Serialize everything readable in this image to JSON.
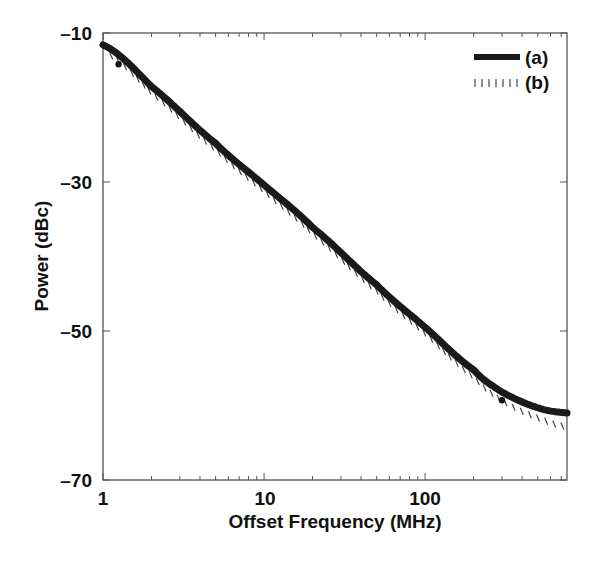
{
  "chart_data": {
    "type": "line",
    "title": "",
    "xlabel": "Offset Frequency (MHz)",
    "ylabel": "Power (dBc)",
    "xscale": "log",
    "xlim": [
      1,
      760
    ],
    "ylim": [
      -70,
      -10
    ],
    "xticks": [
      "1",
      "10",
      "100"
    ],
    "yticks": [
      "-10",
      "-30",
      "-50",
      "-70"
    ],
    "grid": false,
    "legend_position": "upper right",
    "series": [
      {
        "name": "(a)",
        "style": "thick solid",
        "x": [
          1,
          2,
          5,
          10,
          20,
          50,
          100,
          200,
          300,
          500,
          760
        ],
        "y": [
          -11.6,
          -17.2,
          -24.8,
          -30.4,
          -36.1,
          -43.8,
          -49.5,
          -55.2,
          -58.2,
          -60.3,
          -61.0
        ]
      },
      {
        "name": "(b)",
        "style": "hatched",
        "x": [
          1,
          2,
          5,
          10,
          20,
          50,
          100,
          200,
          300,
          500,
          760
        ],
        "y": [
          -12.4,
          -18.0,
          -25.6,
          -31.2,
          -36.9,
          -44.6,
          -50.3,
          -56.1,
          -59.3,
          -61.6,
          -62.8
        ]
      }
    ],
    "markers": [
      {
        "x": 1.25,
        "y": -14.2
      },
      {
        "x": 300,
        "y": -59.3
      }
    ]
  }
}
